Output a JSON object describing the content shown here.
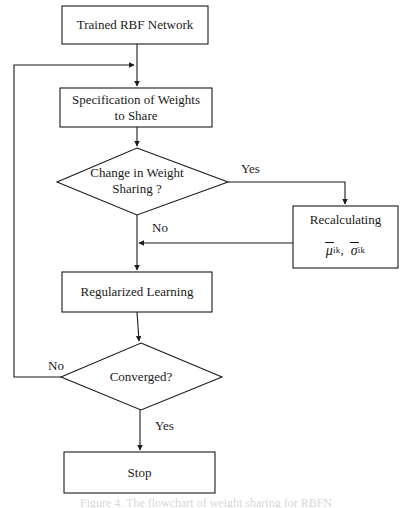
{
  "figure": {
    "type": "flowchart",
    "caption": "Figure 4. The flowchart of weight sharing for RBFN",
    "background_color": "#ffffff",
    "line_color": "#1a1a1a"
  },
  "nodes": {
    "start": {
      "shape": "rectangle",
      "label": "Trained RBF Network"
    },
    "specification": {
      "shape": "rectangle",
      "label": "Specification of Weights\nto Share"
    },
    "change_decision": {
      "shape": "diamond",
      "label": "Change in Weight\nSharing ?"
    },
    "recalculating": {
      "shape": "rectangle",
      "label": "Recalculating",
      "formula_mu": "μ",
      "formula_mu_sub": "ik",
      "formula_separator": ",",
      "formula_sigma": "σ",
      "formula_sigma_sub": "ik"
    },
    "regularized": {
      "shape": "rectangle",
      "label": "Regularized Learning"
    },
    "converged_decision": {
      "shape": "diamond",
      "label": "Converged?"
    },
    "stop": {
      "shape": "rectangle",
      "label": "Stop"
    }
  },
  "edge_labels": {
    "change_yes": "Yes",
    "change_no": "No",
    "converged_no": "No",
    "converged_yes": "Yes"
  },
  "edges": [
    {
      "from": "start",
      "to": "specification",
      "label": ""
    },
    {
      "from": "specification",
      "to": "change_decision",
      "label": ""
    },
    {
      "from": "change_decision",
      "to": "recalculating",
      "label": "Yes"
    },
    {
      "from": "recalculating",
      "to": "regularized",
      "label": ""
    },
    {
      "from": "change_decision",
      "to": "regularized",
      "label": "No"
    },
    {
      "from": "regularized",
      "to": "converged_decision",
      "label": ""
    },
    {
      "from": "converged_decision",
      "to": "specification",
      "label": "No"
    },
    {
      "from": "converged_decision",
      "to": "stop",
      "label": "Yes"
    }
  ]
}
